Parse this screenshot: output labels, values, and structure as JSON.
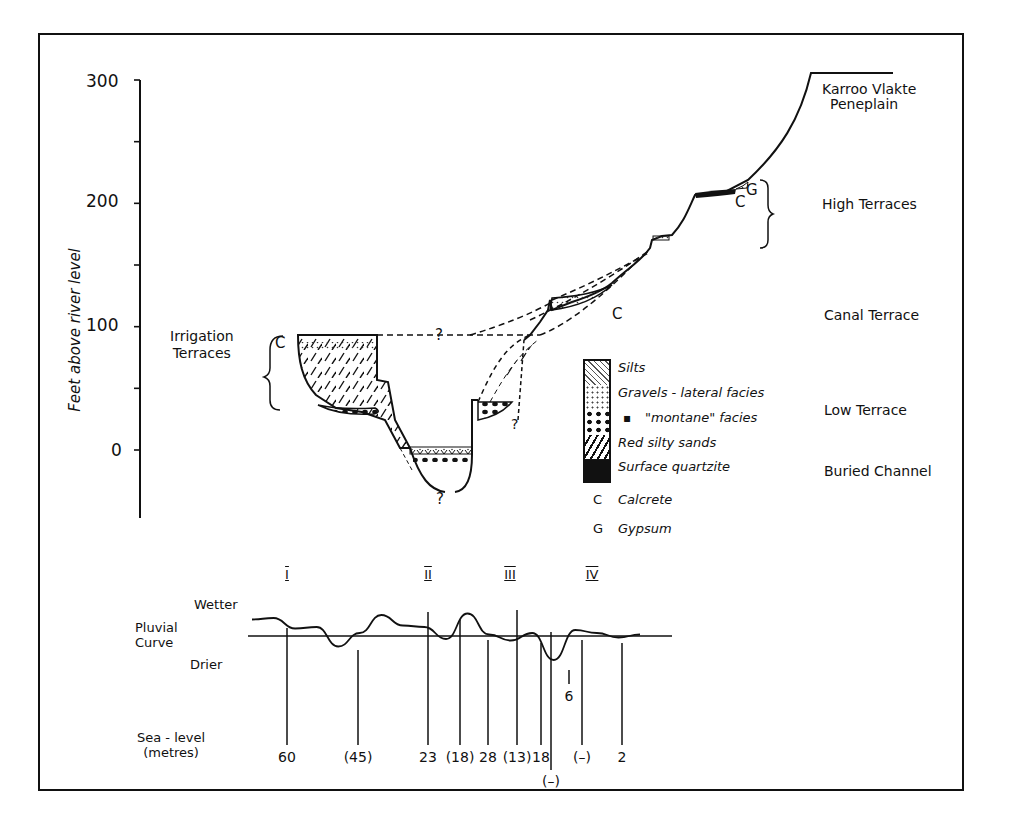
{
  "diagram": {
    "y_axis": {
      "label": "Feet above river level",
      "ticks": [
        "300",
        "200",
        "100",
        "0"
      ],
      "range": [
        -50,
        300
      ],
      "minor_step": 50
    },
    "annotations": {
      "question_marks": [
        "?",
        "?",
        "?",
        "?"
      ],
      "calcrete_markers": [
        "C",
        "C",
        "C"
      ],
      "gypsum_marker": "G"
    },
    "terrace_labels": [
      {
        "id": "karroo",
        "lines": [
          "Karroo Vlakte",
          "Peneplain"
        ]
      },
      {
        "id": "high",
        "lines": [
          "High Terraces"
        ]
      },
      {
        "id": "canal",
        "lines": [
          "Canal Terrace"
        ]
      },
      {
        "id": "low",
        "lines": [
          "Low Terrace"
        ]
      },
      {
        "id": "buried",
        "lines": [
          "Buried Channel"
        ]
      },
      {
        "id": "irrigation",
        "lines": [
          "Irrigation",
          "Terraces"
        ]
      }
    ],
    "legend": {
      "items": [
        {
          "pattern": "silts",
          "label": "Silts"
        },
        {
          "pattern": "gravels-lateral",
          "label": "Gravels - lateral facies"
        },
        {
          "pattern": "gravels-montane",
          "label": "\"montane\" facies",
          "ditto": "▪"
        },
        {
          "pattern": "red-silty-sands",
          "label": "Red silty sands"
        },
        {
          "pattern": "surface-quartzite",
          "label": "Surface quartzite"
        }
      ],
      "symbols": [
        {
          "symbol": "C",
          "label": "Calcrete"
        },
        {
          "symbol": "G",
          "label": "Gypsum"
        }
      ]
    },
    "pluvial": {
      "title_lines": [
        "Pluvial",
        "Curve"
      ],
      "wetter": "Wetter",
      "drier": "Drier",
      "periods": [
        "I",
        "II",
        "III",
        "IV"
      ],
      "sea_level_title": [
        "Sea - level",
        "(metres)"
      ],
      "sea_levels": [
        "60",
        "(45)",
        "23",
        "(18)",
        "28",
        "(13)",
        "18",
        "(–)",
        "6",
        "(–)",
        "2"
      ],
      "curve_values": [
        0.55,
        0.6,
        0.25,
        0.3,
        -0.35,
        0.1,
        0.7,
        0.35,
        0.3,
        -0.1,
        0.75,
        0.05,
        -0.15,
        0.1,
        -0.8,
        0.2,
        0.1,
        -0.05,
        0.05
      ]
    }
  }
}
